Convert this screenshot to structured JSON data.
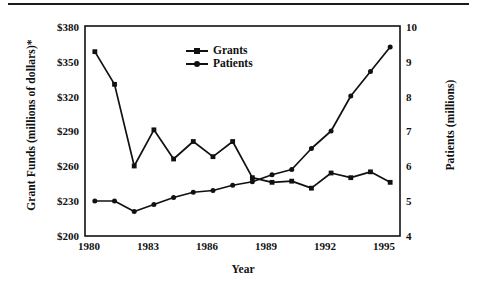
{
  "chart_data": {
    "type": "line",
    "title": "",
    "xlabel": "Year",
    "ylabel": "Grant Funds (millions of dollars)*",
    "ylabel_right": "Patients (millions)",
    "x": [
      1980,
      1981,
      1982,
      1983,
      1984,
      1985,
      1986,
      1987,
      1988,
      1989,
      1990,
      1991,
      1992,
      1993,
      1994,
      1995
    ],
    "xlim": [
      1979.5,
      1995.5
    ],
    "xticks": [
      "1980",
      "1983",
      "1986",
      "1989",
      "1992",
      "1995"
    ],
    "xtick_values": [
      1980,
      1983,
      1986,
      1989,
      1992,
      1995
    ],
    "ylim": [
      200,
      380
    ],
    "yticks": [
      "$200",
      "$230",
      "$260",
      "$290",
      "$320",
      "$350",
      "$380"
    ],
    "ytick_values": [
      200,
      230,
      260,
      290,
      320,
      350,
      380
    ],
    "ylim_right": [
      4,
      10
    ],
    "yticks_right": [
      "4",
      "5",
      "6",
      "7",
      "8",
      "9",
      "10"
    ],
    "ytick_values_right": [
      4,
      5,
      6,
      7,
      8,
      9,
      10
    ],
    "grid": false,
    "legend_position": "upper-center",
    "series": [
      {
        "name": "Grants",
        "axis": "left",
        "marker": "square",
        "color": "#111111",
        "values": [
          358,
          330,
          260,
          291,
          266,
          281,
          268,
          281,
          250,
          246,
          247,
          241,
          254,
          250,
          255,
          246
        ]
      },
      {
        "name": "Patients",
        "axis": "right",
        "marker": "circle",
        "color": "#111111",
        "values": [
          5.0,
          5.0,
          4.7,
          4.9,
          5.1,
          5.25,
          5.3,
          5.45,
          5.55,
          5.75,
          5.9,
          6.5,
          7.0,
          8.0,
          8.7,
          9.4
        ]
      }
    ]
  },
  "legend": {
    "items": [
      {
        "label": "Grants",
        "marker": "square"
      },
      {
        "label": "Patients",
        "marker": "circle"
      }
    ]
  }
}
